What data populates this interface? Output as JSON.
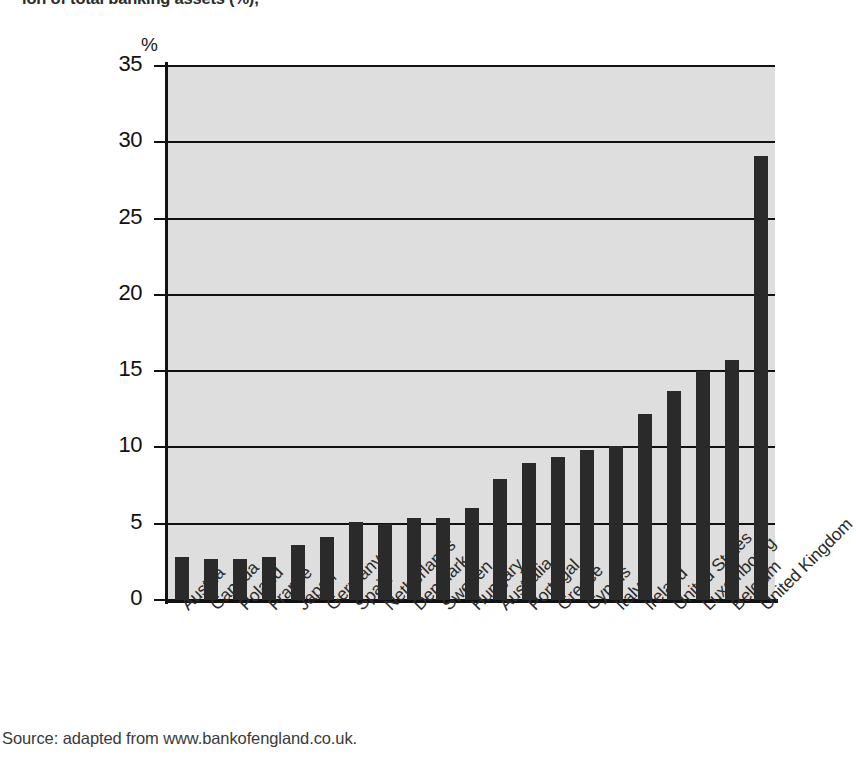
{
  "chart_data": {
    "type": "bar",
    "title_visible_fragment": "ion of total banking assets (%),",
    "subtitle": "",
    "xlabel": "",
    "ylabel": "%",
    "ylim": [
      0,
      35
    ],
    "ytick_values": [
      0,
      5,
      10,
      15,
      20,
      25,
      30,
      35
    ],
    "ytick_labels": [
      "0",
      "5",
      "10",
      "15",
      "20",
      "25",
      "30",
      "35"
    ],
    "grid": true,
    "legend": false,
    "legend_position": "none",
    "bar_color": "#2a2a2a",
    "plot_background": "#dedede",
    "categories": [
      "Austria",
      "Canada",
      "Poland",
      "France",
      "Japan",
      "Germany",
      "Spain",
      "Netherlands",
      "Denmark",
      "Sweden",
      "Hungary",
      "Australia",
      "Portugal",
      "Greece",
      "Cyprus",
      "Italy",
      "Ireland",
      "United States",
      "Luxembourg",
      "Belgium",
      "United Kingdom"
    ],
    "values": [
      2.8,
      2.7,
      2.7,
      2.8,
      3.6,
      4.1,
      5.1,
      5.0,
      5.35,
      5.4,
      6.0,
      7.9,
      9.0,
      9.4,
      9.8,
      10.1,
      12.2,
      13.7,
      15.0,
      15.7,
      29.1
    ]
  },
  "source_note": "Source: adapted from www.bankofengland.co.uk."
}
